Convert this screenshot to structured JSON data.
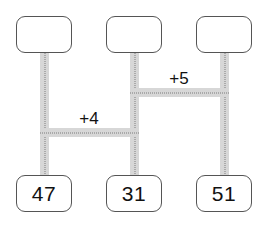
{
  "diagram": {
    "type": "comparison-bar-model",
    "columns": [
      {
        "id": "col-1",
        "top_box_label": "",
        "bottom_box_label": "47"
      },
      {
        "id": "col-2",
        "top_box_label": "",
        "bottom_box_label": "31"
      },
      {
        "id": "col-3",
        "top_box_label": "",
        "bottom_box_label": "51"
      }
    ],
    "connectors": [
      {
        "id": "edge-1-2",
        "label": "+4",
        "from": "col-1",
        "to": "col-2"
      },
      {
        "id": "edge-2-3",
        "label": "+5",
        "from": "col-2",
        "to": "col-3"
      }
    ],
    "colors": {
      "background": "#ffffff",
      "box_border": "#555555",
      "pipe_fill": "#d7d7d7",
      "pipe_dots": "#7d7d7d",
      "text": "#111111"
    }
  }
}
